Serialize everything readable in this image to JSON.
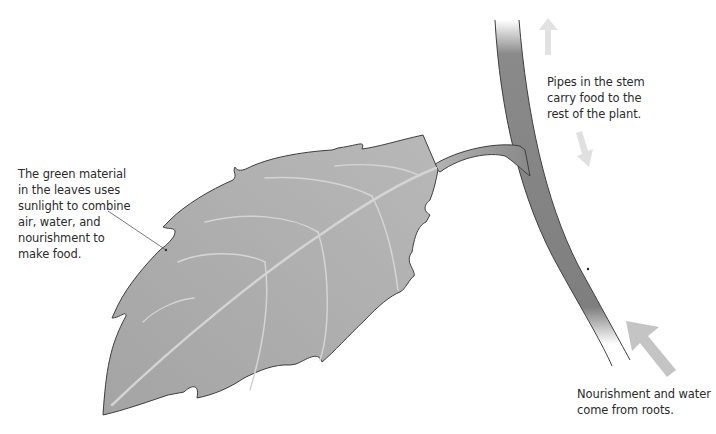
{
  "diagram": {
    "labels": {
      "leaf": "The green material\nin the leaves uses\nsunlight to combine\nair, water, and\nnourishment to\nmake food.",
      "stem": "Pipes in the stem\ncarry food to the\nrest of the plant.",
      "roots": "Nourishment and water\ncome from roots."
    },
    "parts": [
      {
        "name": "leaf",
        "color": "#a9a9a9"
      },
      {
        "name": "leaf-veins",
        "color": "#d2d2d2"
      },
      {
        "name": "petiole",
        "color": "#9a9a9a"
      },
      {
        "name": "stem",
        "color": "#7d7d7d"
      }
    ],
    "arrows": [
      {
        "name": "up-arrow",
        "direction": "up",
        "meaning": "food travels up the stem",
        "color": "#e2e2e2"
      },
      {
        "name": "down-arrow",
        "direction": "down",
        "meaning": "food travels down the stem",
        "color": "#e2e2e2"
      },
      {
        "name": "roots-arrow",
        "direction": "up-left",
        "meaning": "nourishment and water from roots",
        "color": "#c4c4c4"
      }
    ],
    "colors": {
      "background": "#ffffff",
      "text": "#2b2b2b",
      "outline": "#4a4a4a",
      "leader_line": "#555555"
    }
  }
}
